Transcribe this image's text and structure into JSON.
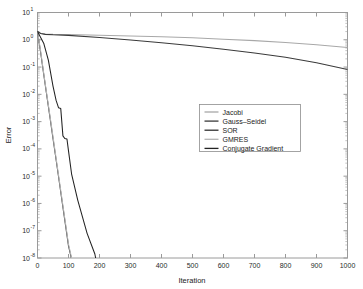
{
  "figure": {
    "background_color": "#ffffff",
    "frame_color": "#9a9a9a"
  },
  "chart_data": {
    "type": "line",
    "title": "",
    "xlabel": "Iteration",
    "ylabel": "Error",
    "xlim": [
      0,
      1000
    ],
    "ylim": [
      1e-08,
      10
    ],
    "yscale": "log",
    "grid": false,
    "legend_position": "center-right",
    "xticks": [
      0,
      100,
      200,
      300,
      400,
      500,
      600,
      700,
      800,
      900,
      1000
    ],
    "xtick_labels": [
      "0",
      "100",
      "200",
      "300",
      "400",
      "500",
      "600",
      "700",
      "800",
      "900",
      "1000"
    ],
    "yticks": [
      10,
      1,
      0.1,
      0.01,
      0.001,
      0.0001,
      1e-05,
      1e-06,
      1e-07,
      1e-08
    ],
    "ytick_labels": [
      "10^1",
      "10^0",
      "10^-1",
      "10^-2",
      "10^-3",
      "10^-4",
      "10^-5",
      "10^-6",
      "10^-7",
      "10^-8"
    ],
    "ytick_mantissa": [
      "10",
      "10",
      "10",
      "10",
      "10",
      "10",
      "10",
      "10",
      "10",
      "10"
    ],
    "ytick_exponents": [
      "1",
      "0",
      "-1",
      "-2",
      "-3",
      "-4",
      "-5",
      "-6",
      "-7",
      "-8"
    ],
    "series": [
      {
        "name": "Jacobi",
        "color": "#a8a8a8",
        "x": [
          0,
          10,
          25,
          50,
          100,
          200,
          300,
          400,
          500,
          600,
          700,
          800,
          900,
          1000
        ],
        "y": [
          2.0,
          1.75,
          1.62,
          1.58,
          1.55,
          1.47,
          1.38,
          1.28,
          1.18,
          1.05,
          0.93,
          0.8,
          0.66,
          0.52
        ]
      },
      {
        "name": "Gauss-Seidel",
        "color": "#3a3a3a",
        "x": [
          0,
          10,
          25,
          50,
          100,
          200,
          300,
          400,
          500,
          600,
          700,
          800,
          900,
          1000
        ],
        "y": [
          2.0,
          1.7,
          1.58,
          1.52,
          1.45,
          1.22,
          0.98,
          0.78,
          0.6,
          0.45,
          0.33,
          0.23,
          0.145,
          0.082
        ]
      },
      {
        "name": "SOR",
        "color": "#2f2f2f",
        "x": [
          0,
          10,
          20,
          30,
          40,
          50,
          60,
          70,
          80,
          90,
          100,
          110,
          120,
          130
        ],
        "y": [
          2.0,
          0.35,
          0.055,
          0.009,
          0.0015,
          0.00024,
          4e-05,
          6.5e-06,
          1.05e-06,
          1.7e-07,
          2.8e-08,
          9e-09,
          3e-09,
          1e-09
        ]
      },
      {
        "name": "GMRES",
        "color": "#b4b4b4",
        "x": [
          0,
          10,
          20,
          30,
          40,
          50,
          60,
          70,
          80,
          90,
          100,
          110,
          120,
          130
        ],
        "y": [
          2.0,
          0.4,
          0.06,
          0.01,
          0.0017,
          0.00028,
          4.6e-05,
          7.5e-06,
          1.2e-06,
          2e-07,
          3.2e-08,
          1e-08,
          3.4e-09,
          1.1e-09
        ]
      },
      {
        "name": "Conjugate Gradient",
        "color": "#232323",
        "x": [
          0,
          20,
          35,
          50,
          60,
          68,
          75,
          82,
          88,
          95,
          100,
          110,
          130,
          160,
          185,
          200,
          205
        ],
        "y": [
          2.0,
          0.75,
          0.18,
          0.02,
          0.006,
          0.0032,
          0.003,
          0.0003,
          0.00024,
          0.00023,
          8.5e-05,
          1.2e-05,
          1.3e-06,
          8e-08,
          1.4e-08,
          2e-09,
          1e-09
        ]
      }
    ]
  },
  "legend": {
    "entries": [
      {
        "label": "Jacobi",
        "color": "#a8a8a8"
      },
      {
        "label": "Gauss–Seidel",
        "color": "#3a3a3a"
      },
      {
        "label": "SOR",
        "color": "#2f2f2f"
      },
      {
        "label": "GMRES",
        "color": "#b4b4b4"
      },
      {
        "label": "Conjugate Gradient",
        "color": "#232323"
      }
    ]
  }
}
